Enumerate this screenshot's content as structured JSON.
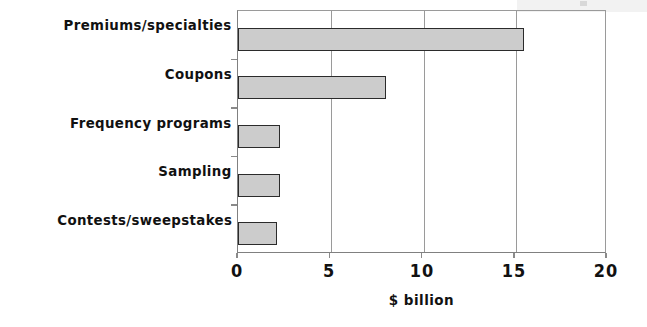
{
  "chart_data": {
    "type": "bar",
    "orientation": "horizontal",
    "title": "",
    "xlabel": "$ billion",
    "ylabel": "",
    "categories": [
      "Premiums/specialties",
      "Coupons",
      "Frequency programs",
      "Sampling",
      "Contests/sweepstakes"
    ],
    "values": [
      15.5,
      8.0,
      2.3,
      2.3,
      2.1
    ],
    "xlim": [
      0,
      20
    ],
    "xticks": [
      0,
      5,
      10,
      15,
      20
    ],
    "xtick_labels": [
      "0",
      "5",
      "10",
      "15",
      "20"
    ],
    "grid": "vertical-only",
    "legend": "none",
    "bar_fill_color": "#cccccc",
    "bar_border_color": "#2b2b2b",
    "axis_color": "#8a8a8a",
    "text_color": "#111111",
    "background_color": "#ffffff"
  },
  "axis": {
    "x_title": "$ billion",
    "ticks": [
      {
        "label": "0",
        "value": 0
      },
      {
        "label": "5",
        "value": 5
      },
      {
        "label": "10",
        "value": 10
      },
      {
        "label": "15",
        "value": 15
      },
      {
        "label": "20",
        "value": 20
      }
    ]
  },
  "bars": [
    {
      "label": "Premiums/specialties",
      "value": 15.5
    },
    {
      "label": "Coupons",
      "value": 8.0
    },
    {
      "label": "Frequency programs",
      "value": 2.3
    },
    {
      "label": "Sampling",
      "value": 2.3
    },
    {
      "label": "Contests/sweepstakes",
      "value": 2.1
    }
  ]
}
